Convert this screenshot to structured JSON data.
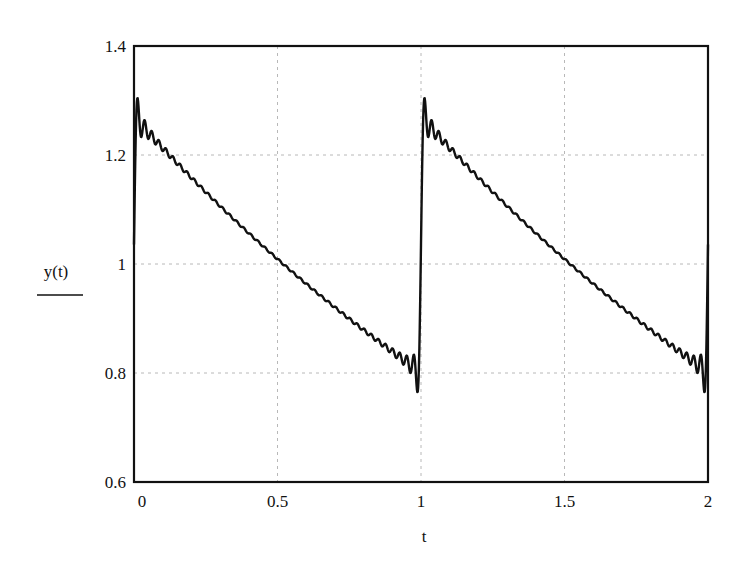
{
  "chart_data": {
    "type": "line",
    "title": "",
    "xlabel": "t",
    "ylabel": "y(t)",
    "xlim": [
      0,
      2
    ],
    "ylim": [
      0.6,
      1.4
    ],
    "x_ticks": [
      0,
      0.5,
      1,
      1.5,
      2
    ],
    "x_tick_labels": [
      "0",
      "0.5",
      "1",
      "1.5",
      "2"
    ],
    "y_ticks": [
      0.6,
      0.8,
      1,
      1.2,
      1.4
    ],
    "y_tick_labels": [
      "0.6",
      "0.8",
      "1",
      "1.2",
      "1.4"
    ],
    "grid": true,
    "legend": null,
    "series": [
      {
        "name": "y(t)",
        "description": "Periodic (period 1) exponentially decaying sawtooth reconstructed by truncated Fourier series; Gibbs ripple near discontinuities at t=0, 1, 2",
        "x": [
          0.0,
          0.01,
          0.05,
          0.1,
          0.2,
          0.3,
          0.4,
          0.5,
          0.6,
          0.7,
          0.8,
          0.9,
          0.97,
          0.99,
          1.0,
          1.01,
          1.05,
          1.1,
          1.2,
          1.3,
          1.4,
          1.5,
          1.6,
          1.7,
          1.8,
          1.9,
          1.97,
          1.99,
          2.0
        ],
        "values": [
          1.03,
          1.33,
          1.26,
          1.23,
          1.16,
          1.11,
          1.05,
          1.0,
          0.95,
          0.91,
          0.87,
          0.83,
          0.8,
          0.75,
          1.03,
          1.33,
          1.26,
          1.23,
          1.16,
          1.11,
          1.05,
          1.0,
          0.95,
          0.91,
          0.87,
          0.83,
          0.8,
          0.75,
          1.03
        ]
      }
    ],
    "model": {
      "amplitude": 1.27,
      "decay_rate": 0.46,
      "period": 1,
      "harmonics": 40
    }
  },
  "style": {
    "line_color": "#111111",
    "frame_color": "#111111",
    "grid_color": "#b8b8b8",
    "background": "#ffffff"
  }
}
